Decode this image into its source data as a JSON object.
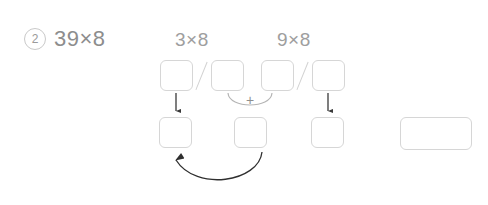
{
  "problem": {
    "number": "2",
    "expression": "39×8"
  },
  "decomposition": {
    "tens_label": "3×8",
    "ones_label": "9×8",
    "operator": "+"
  },
  "boxes": {
    "top": [
      {
        "name": "tens-product-tens-digit",
        "value": ""
      },
      {
        "name": "tens-product-ones-digit",
        "value": ""
      },
      {
        "name": "ones-product-tens-digit",
        "value": ""
      },
      {
        "name": "ones-product-ones-digit",
        "value": ""
      }
    ],
    "bottom": [
      {
        "name": "result-hundreds-digit",
        "value": ""
      },
      {
        "name": "result-tens-digit",
        "value": ""
      },
      {
        "name": "result-ones-digit",
        "value": ""
      }
    ],
    "result": {
      "name": "final-answer",
      "value": ""
    }
  },
  "colors": {
    "box_border": "#d6d6d6",
    "text": "#8d8d8d",
    "badge_border": "#c9c9c9",
    "arrow": "#3a3a3a",
    "arc": "#b5b5b5",
    "slash": "#d2d2d2"
  }
}
